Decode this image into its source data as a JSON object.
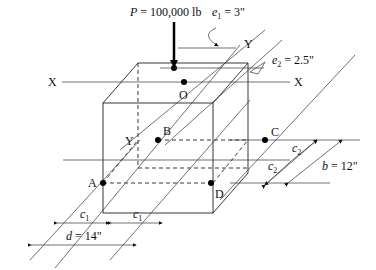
{
  "diagram": {
    "load": {
      "label": "P = 100,000 lb",
      "symbol": "P",
      "value": "100,000 lb"
    },
    "eccentricities": [
      {
        "label": "e1 = 3\"",
        "symbol": "e",
        "sub": "1",
        "value": "3\""
      },
      {
        "label": "e2 = 2.5\"",
        "symbol": "e",
        "sub": "2",
        "value": "2.5\""
      }
    ],
    "axes": {
      "x_left": "X",
      "x_right": "X",
      "y_top": "Y",
      "y_bottom": "Y"
    },
    "points": {
      "O": "O",
      "A": "A",
      "B": "B",
      "C": "C",
      "D": "D"
    },
    "dimensions": {
      "c1_left": {
        "symbol": "c",
        "sub": "1"
      },
      "c1_right": {
        "symbol": "c",
        "sub": "1"
      },
      "c2_top": {
        "symbol": "c",
        "sub": "2"
      },
      "c2_bottom": {
        "symbol": "c",
        "sub": "2"
      },
      "b": {
        "label": "b = 12\"",
        "symbol": "b",
        "value": "12\""
      },
      "d": {
        "label": "d = 14\"",
        "symbol": "d",
        "value": "14\""
      }
    },
    "colors": {
      "line": "#222222",
      "background": "#ffffff"
    }
  }
}
